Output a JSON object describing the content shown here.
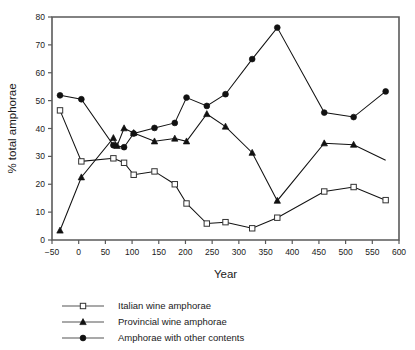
{
  "chart_data": {
    "type": "line",
    "title": "",
    "xlabel": "Year",
    "ylabel": "% total amphorae",
    "xlim": [
      -50,
      600
    ],
    "ylim": [
      0,
      80
    ],
    "xticks": [
      -50,
      0,
      50,
      100,
      150,
      200,
      250,
      300,
      350,
      400,
      450,
      500,
      550,
      600
    ],
    "yticks": [
      0,
      10,
      20,
      30,
      40,
      50,
      60,
      70,
      80
    ],
    "xtick_labels": [
      "−50",
      "0",
      "50",
      "100",
      "150",
      "200",
      "250",
      "300",
      "350",
      "400",
      "450",
      "500",
      "550",
      "600"
    ],
    "ytick_labels": [
      "0",
      "10",
      "20",
      "30",
      "40",
      "50",
      "60",
      "70",
      "80"
    ],
    "grid": false,
    "legend_position": "below",
    "series": [
      {
        "name": "Italian wine amphorae",
        "marker": "open-square",
        "color": "#111111",
        "points": [
          {
            "x": -35,
            "y": 46.5
          },
          {
            "x": 5,
            "y": 28.2
          },
          {
            "x": 65,
            "y": 29.3
          },
          {
            "x": 85,
            "y": 27.7
          },
          {
            "x": 103,
            "y": 23.4
          },
          {
            "x": 142,
            "y": 24.6
          },
          {
            "x": 180,
            "y": 20.0
          },
          {
            "x": 202,
            "y": 13.1
          },
          {
            "x": 240,
            "y": 5.9
          },
          {
            "x": 275,
            "y": 6.4
          },
          {
            "x": 325,
            "y": 4.2
          },
          {
            "x": 372,
            "y": 8.0
          },
          {
            "x": 460,
            "y": 17.4
          },
          {
            "x": 515,
            "y": 19.0
          },
          {
            "x": 575,
            "y": 14.3
          }
        ]
      },
      {
        "name": "Provincial wine amphorae",
        "marker": "solid-triangle",
        "color": "#111111",
        "points": [
          {
            "x": -35,
            "y": 3.4
          },
          {
            "x": 5,
            "y": 22.5
          },
          {
            "x": 65,
            "y": 36.6
          },
          {
            "x": 72,
            "y": 33.8
          },
          {
            "x": 85,
            "y": 40.1
          },
          {
            "x": 103,
            "y": 38.4
          },
          {
            "x": 142,
            "y": 35.4
          },
          {
            "x": 180,
            "y": 36.4
          },
          {
            "x": 202,
            "y": 35.4
          },
          {
            "x": 240,
            "y": 45.2
          },
          {
            "x": 275,
            "y": 40.7
          },
          {
            "x": 325,
            "y": 31.3
          },
          {
            "x": 372,
            "y": 14.1
          },
          {
            "x": 460,
            "y": 34.7
          },
          {
            "x": 515,
            "y": 34.2
          },
          {
            "x": 575,
            "y": 28.6
          }
        ],
        "tail_unmarked": true
      },
      {
        "name": "Amphorae with other contents",
        "marker": "solid-circle",
        "color": "#111111",
        "points": [
          {
            "x": -35,
            "y": 51.9
          },
          {
            "x": 5,
            "y": 50.5
          },
          {
            "x": 65,
            "y": 34.0
          },
          {
            "x": 85,
            "y": 33.3
          },
          {
            "x": 103,
            "y": 38.2
          },
          {
            "x": 142,
            "y": 40.2
          },
          {
            "x": 180,
            "y": 42.0
          },
          {
            "x": 202,
            "y": 51.1
          },
          {
            "x": 240,
            "y": 48.1
          },
          {
            "x": 275,
            "y": 52.3
          },
          {
            "x": 325,
            "y": 64.9
          },
          {
            "x": 372,
            "y": 76.2
          },
          {
            "x": 460,
            "y": 45.7
          },
          {
            "x": 515,
            "y": 44.1
          },
          {
            "x": 575,
            "y": 53.3
          }
        ]
      }
    ]
  },
  "legend": {
    "items": [
      {
        "label": "Italian wine amphorae",
        "marker": "open-square"
      },
      {
        "label": "Provincial wine amphorae",
        "marker": "solid-triangle"
      },
      {
        "label": "Amphorae with other contents",
        "marker": "solid-circle"
      }
    ]
  }
}
